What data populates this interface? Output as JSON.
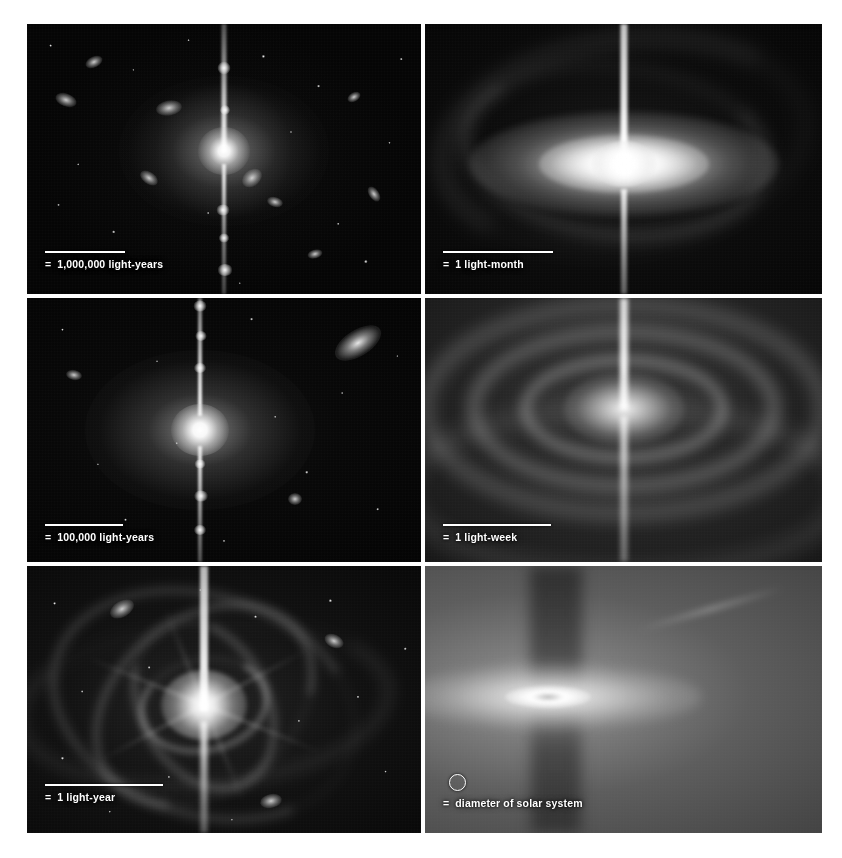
{
  "figure": {
    "background_color": "#ffffff",
    "columns": 2,
    "rows": 3,
    "panel_count": 6
  },
  "panels": [
    {
      "id": "panel-1",
      "position": "top-left",
      "subject": "host galaxy with bipolar jet and surrounding galaxies",
      "scale": {
        "marker": "bar",
        "equals": "=",
        "label": "1,000,000 light-years",
        "bar_length_px": 80
      }
    },
    {
      "id": "panel-2",
      "position": "top-right",
      "subject": "bright accretion disk with vertical jet and spiral arms",
      "scale": {
        "marker": "bar",
        "equals": "=",
        "label": "1 light-month",
        "bar_length_px": 110
      }
    },
    {
      "id": "panel-3",
      "position": "middle-left",
      "subject": "elliptical galaxy core with knotted jet and companion galaxy",
      "scale": {
        "marker": "bar",
        "equals": "=",
        "label": "100,000 light-years",
        "bar_length_px": 78
      }
    },
    {
      "id": "panel-4",
      "position": "middle-right",
      "subject": "concentric gas rings around the nucleus with vertical jet",
      "scale": {
        "marker": "bar",
        "equals": "=",
        "label": "1 light-week",
        "bar_length_px": 108
      }
    },
    {
      "id": "panel-5",
      "position": "bottom-left",
      "subject": "spiral filaments of infalling gas around the bright core",
      "scale": {
        "marker": "bar",
        "equals": "=",
        "label": "1 light-year",
        "bar_length_px": 118
      }
    },
    {
      "id": "panel-6",
      "position": "bottom-right",
      "subject": "innermost accretion disk seen edge-on with dark jet funnel",
      "scale": {
        "marker": "circle",
        "equals": "=",
        "label": "diameter of solar system",
        "circle_diameter_px": 15
      }
    }
  ],
  "colors": {
    "background": "#ffffff",
    "panel_dark": "#050505",
    "annotation": "#ffffff"
  }
}
